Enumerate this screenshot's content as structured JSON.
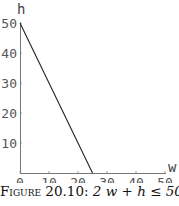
{
  "chart_data": {
    "type": "line",
    "title": "",
    "xlabel": "w",
    "ylabel": "h",
    "xlim": [
      0,
      50
    ],
    "ylim": [
      0,
      50
    ],
    "x_ticks": [
      0,
      10,
      20,
      30,
      40,
      50
    ],
    "y_ticks": [
      10,
      20,
      30,
      40,
      50
    ],
    "grid": false,
    "legend": null,
    "series": [
      {
        "name": "2w + h = 50",
        "x": [
          0,
          25
        ],
        "y": [
          50,
          0
        ],
        "color": "#222222"
      }
    ]
  },
  "caption": {
    "figure_label": "Figure 20.10:",
    "expression": "2 w + h ≤ 50"
  }
}
